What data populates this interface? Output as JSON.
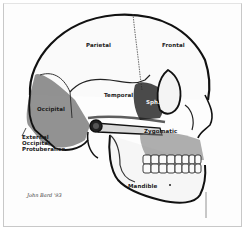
{
  "figure": {
    "colors": {
      "ink": "#111111",
      "paper": "#fdfdfd",
      "frame": "#c8c8c8",
      "shade": "#555555"
    }
  },
  "labels": {
    "parietal": "Parietal",
    "frontal": "Frontal",
    "temporal": "Temporal",
    "sphenoid": "Sph.",
    "occipital": "Occipital",
    "zygomatic": "Zygomatic",
    "external_occipital_line1": "External",
    "external_occipital_line2": "Occipital",
    "external_occipital_line3": "Protuberance",
    "mandible": "Mandible"
  },
  "signature": "John Bard '93"
}
